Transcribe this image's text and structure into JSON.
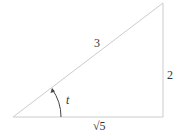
{
  "figure": {
    "type": "right-triangle",
    "vertices": {
      "angle_vertex": [
        13,
        117
      ],
      "right_angle_vertex": [
        163,
        117
      ],
      "top_vertex": [
        163,
        3
      ]
    },
    "sides": {
      "hypotenuse": {
        "label": "3"
      },
      "opposite": {
        "label": "2"
      },
      "adjacent": {
        "label": "√5"
      }
    },
    "angle": {
      "label": "t"
    },
    "colors": {
      "triangle_stroke": "#cccccc",
      "arc_stroke": "#444444",
      "text": "#333333"
    }
  }
}
